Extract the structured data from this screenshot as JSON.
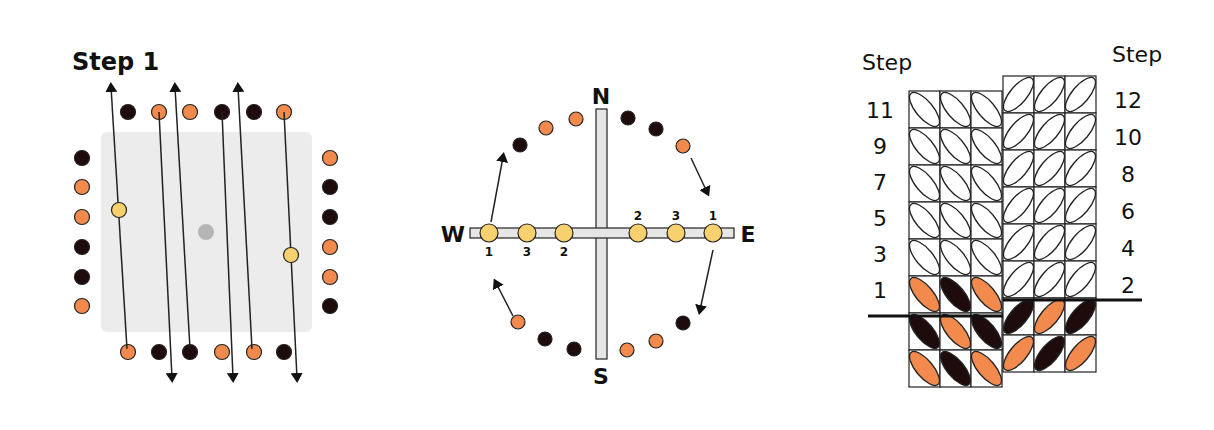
{
  "panel1": {
    "title": "Step 1",
    "top_row": [
      "dark",
      "orange",
      "orange",
      "dark",
      "dark",
      "orange"
    ],
    "bottom_row": [
      "orange",
      "dark",
      "dark",
      "orange",
      "orange",
      "dark"
    ],
    "left_col": [
      "dark",
      "orange",
      "orange",
      "dark",
      "dark",
      "orange"
    ],
    "right_col": [
      "orange",
      "dark",
      "dark",
      "orange",
      "orange",
      "dark"
    ]
  },
  "panel2": {
    "north": "N",
    "south": "S",
    "west": "W",
    "east": "E",
    "west_labels": [
      "1",
      "3",
      "2"
    ],
    "east_labels": [
      "2",
      "3",
      "1"
    ]
  },
  "panel3": {
    "left_heading": "Step",
    "right_heading": "Step",
    "left_steps": [
      "11",
      "9",
      "7",
      "5",
      "3",
      "1"
    ],
    "right_steps": [
      "12",
      "10",
      "8",
      "6",
      "4",
      "2"
    ]
  },
  "colors": {
    "orange": "#f28a4e",
    "dark": "#1e0c0c",
    "yellow": "#f9d06e",
    "grey": "#bbbbbb"
  }
}
